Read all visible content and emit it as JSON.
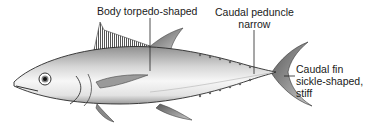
{
  "diagram": {
    "labels": {
      "body": "Body torpedo-shaped",
      "peduncle_line1": "Caudal peduncle",
      "peduncle_line2": "narrow",
      "fin_line1": "Caudal fin",
      "fin_line2": "sickle-shaped,",
      "fin_line3": "stiff"
    },
    "colors": {
      "outline": "#2a2a2a",
      "body_light": "#f4f4f4",
      "body_dark": "#8a8a8a",
      "text": "#1a1a1a"
    }
  }
}
